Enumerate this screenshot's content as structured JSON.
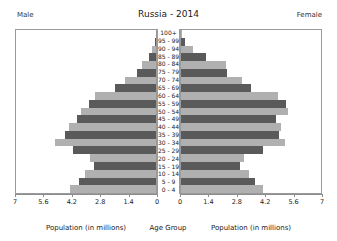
{
  "header": {
    "male_label": "Male",
    "female_label": "Female",
    "title": "Russia - 2014"
  },
  "captions": {
    "left": "Population (in millions)",
    "center": "Age Group",
    "right": "Population (in millions)"
  },
  "chart_data": {
    "type": "bar",
    "subtype": "population-pyramid",
    "title": "Russia - 2014",
    "xlabel": "Population (in millions)",
    "ylabel": "Age Group",
    "grid": false,
    "legend": "none",
    "axis_max": 7,
    "left_tick_labels": [
      "7",
      "5.6",
      "4.2",
      "2.8",
      "1.4",
      "0"
    ],
    "right_tick_labels": [
      "0",
      "1.4",
      "2.8",
      "4.2",
      "5.6",
      "7"
    ],
    "tick_values": [
      0,
      1.4,
      2.8,
      4.2,
      5.6,
      7
    ],
    "categories": [
      "100+",
      "95 - 99",
      "90 - 94",
      "85 - 89",
      "80 - 84",
      "75 - 79",
      "70 - 74",
      "65 - 69",
      "60 - 64",
      "55 - 59",
      "50 - 54",
      "45 - 49",
      "40 - 44",
      "35 - 39",
      "30 - 34",
      "25 - 29",
      "20 - 24",
      "15 - 19",
      "10 - 14",
      "5 - 9",
      "0 - 4"
    ],
    "series": [
      {
        "name": "Male",
        "side": "left",
        "values": [
          0.01,
          0.06,
          0.18,
          0.35,
          0.72,
          0.95,
          1.55,
          2.05,
          3.05,
          3.35,
          3.75,
          3.95,
          4.35,
          4.55,
          5.05,
          4.15,
          3.3,
          3.1,
          3.55,
          3.85,
          4.3
        ]
      },
      {
        "name": "Female",
        "side": "right",
        "values": [
          0.03,
          0.22,
          0.6,
          1.25,
          2.25,
          2.3,
          3.05,
          3.5,
          4.85,
          5.25,
          5.35,
          4.75,
          5.0,
          4.9,
          5.2,
          4.1,
          3.15,
          2.95,
          3.4,
          3.7,
          4.1
        ]
      }
    ],
    "bar_colors": {
      "dark": "#5a5a5a",
      "light": "#b0b0b0",
      "pattern": "alternating-by-row"
    }
  }
}
